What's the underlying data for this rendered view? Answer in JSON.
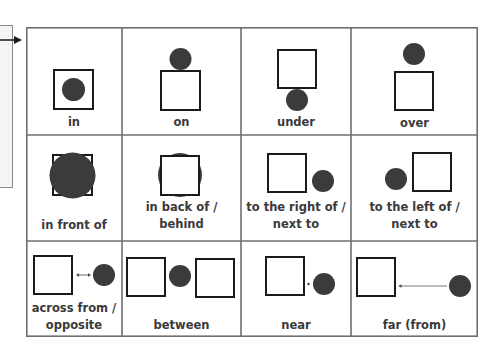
{
  "colors": {
    "grid_line": "#6e6e6e",
    "shape_stroke": "#1a1a1a",
    "circle_fill": "#3b3b3b",
    "label_text": "#3a3a3a"
  },
  "side_panel": {
    "arrow": "right-arrow"
  },
  "grid": {
    "columns": 4,
    "rows": 3,
    "cells": [
      {
        "label_lines": [
          "in"
        ],
        "concept": "in"
      },
      {
        "label_lines": [
          "on"
        ],
        "concept": "on"
      },
      {
        "label_lines": [
          "under"
        ],
        "concept": "under"
      },
      {
        "label_lines": [
          "over"
        ],
        "concept": "over"
      },
      {
        "label_lines": [
          "in front of"
        ],
        "concept": "in front of"
      },
      {
        "label_lines": [
          "in back of /",
          "behind"
        ],
        "concept": "in back of / behind"
      },
      {
        "label_lines": [
          "to the right of /",
          "next to"
        ],
        "concept": "to the right of / next to"
      },
      {
        "label_lines": [
          "to the left of /",
          "next to"
        ],
        "concept": "to the left of / next to"
      },
      {
        "label_lines": [
          "across from /",
          "opposite"
        ],
        "concept": "across from / opposite"
      },
      {
        "label_lines": [
          "between"
        ],
        "concept": "between"
      },
      {
        "label_lines": [
          "near"
        ],
        "concept": "near"
      },
      {
        "label_lines": [
          "far (from)"
        ],
        "concept": "far (from)"
      }
    ]
  }
}
